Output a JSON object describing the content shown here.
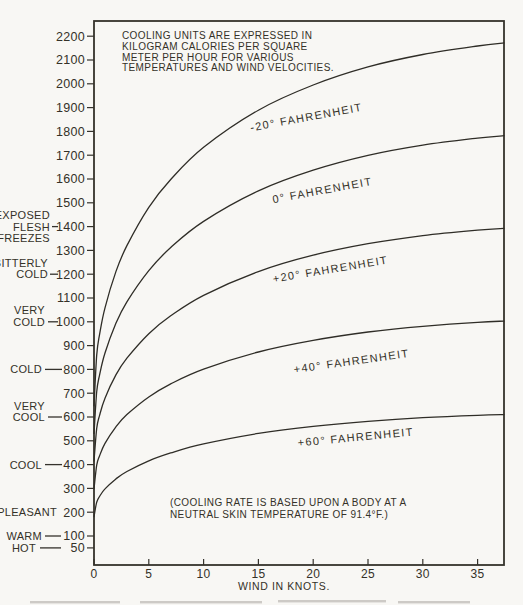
{
  "page": {
    "background": "#f8f7f4",
    "ink": "#35322c",
    "curve_color": "#2f2d27",
    "fragment_color": "#a9a6a0"
  },
  "header_note": {
    "lines": [
      "COOLING UNITS ARE EXPRESSED IN",
      "KILOGRAM CALORIES PER SQUARE",
      "METER PER HOUR FOR VARIOUS",
      "TEMPERATURES AND WIND VELOCITIES."
    ]
  },
  "body_note": {
    "lines": [
      "(COOLING RATE IS BASED UPON A BODY AT A",
      "NEUTRAL SKIN TEMPERATURE OF 91.4°F.)"
    ]
  },
  "sensation_scale": [
    {
      "lines": [
        "EXPOSED",
        "FLESH",
        "FREEZES"
      ],
      "value": 1400,
      "align_line": 1,
      "text_x": 50,
      "dash": [
        52,
        58
      ]
    },
    {
      "lines": [
        "BITTERLY",
        "COLD"
      ],
      "value": 1200,
      "align_line": 1,
      "text_x": 48,
      "dash": [
        50,
        58
      ]
    },
    {
      "lines": [
        "VERY",
        "COLD"
      ],
      "value": 1000,
      "align_line": 1,
      "text_x": 45,
      "dash": [
        48,
        58
      ]
    },
    {
      "lines": [
        "COLD"
      ],
      "value": 800,
      "align_line": 0,
      "text_x": 42,
      "dash": [
        45,
        62
      ]
    },
    {
      "lines": [
        "VERY",
        "COOL"
      ],
      "value": 600,
      "align_line": 1,
      "text_x": 45,
      "dash": [
        48,
        62
      ]
    },
    {
      "lines": [
        "COOL"
      ],
      "value": 400,
      "align_line": 0,
      "text_x": 42,
      "dash": [
        45,
        62
      ]
    },
    {
      "lines": [
        "PLEASANT"
      ],
      "value": 200,
      "align_line": 0,
      "text_x": 57,
      "dash": null
    },
    {
      "lines": [
        "WARM"
      ],
      "value": 100,
      "align_line": 0,
      "text_x": 42,
      "dash": [
        45,
        61
      ]
    },
    {
      "lines": [
        "HOT"
      ],
      "value": 50,
      "align_line": 0,
      "text_x": 36,
      "dash": [
        40,
        61
      ]
    }
  ],
  "chart_data": {
    "type": "line",
    "title": "",
    "xlabel": "WIND IN KNOTS.",
    "ylabel": "",
    "x_ticks": [
      0,
      5,
      10,
      15,
      20,
      25,
      30,
      35
    ],
    "y_ticks": [
      2200,
      2100,
      2000,
      1900,
      1800,
      1700,
      1600,
      1500,
      1400,
      1300,
      1200,
      1100,
      1000,
      900,
      800,
      700,
      600,
      500,
      400,
      300,
      200,
      100,
      50
    ],
    "xlim": [
      0,
      37.4
    ],
    "ylim": [
      0,
      2260
    ],
    "grid": false,
    "legend": "inline-curve-labels",
    "x": [
      0,
      0.25,
      0.5,
      1,
      2,
      3,
      5,
      7,
      10,
      15,
      20,
      25,
      30,
      35,
      37.4
    ],
    "series": [
      {
        "name": "-20° FAHRENHEIT",
        "values": [
          647,
          860,
          945,
          1059,
          1211,
          1320,
          1481,
          1598,
          1733,
          1889,
          1995,
          2071,
          2123,
          2159,
          2172
        ],
        "label": {
          "x": 307,
          "y": 121,
          "angle": -10.5
        }
      },
      {
        "name": "0° FAHRENHEIT",
        "values": [
          531,
          706,
          775,
          869,
          994,
          1084,
          1215,
          1312,
          1422,
          1550,
          1637,
          1699,
          1742,
          1772,
          1782
        ],
        "label": {
          "x": 323,
          "y": 194,
          "angle": -10.5
        }
      },
      {
        "name": "+20° FAHRENHEIT",
        "values": [
          415,
          552,
          606,
          679,
          777,
          847,
          950,
          1025,
          1111,
          1211,
          1280,
          1328,
          1362,
          1385,
          1393
        ],
        "label": {
          "x": 331,
          "y": 273,
          "angle": -9.5
        }
      },
      {
        "name": "+40° FAHRENHEIT",
        "values": [
          299,
          398,
          436,
          489,
          559,
          610,
          684,
          739,
          801,
          873,
          922,
          957,
          981,
          998,
          1003
        ],
        "label": {
          "x": 352,
          "y": 365,
          "angle": -8
        }
      },
      {
        "name": "+60° FAHRENHEIT",
        "values": [
          182,
          242,
          266,
          298,
          340,
          371,
          416,
          449,
          487,
          531,
          561,
          582,
          597,
          607,
          610
        ],
        "label": {
          "x": 356,
          "y": 441,
          "angle": -5.5
        }
      }
    ]
  },
  "caption_fragments": [
    {
      "x1": 30,
      "x2": 120,
      "y": 601
    },
    {
      "x1": 140,
      "x2": 262,
      "y": 601
    },
    {
      "x1": 278,
      "x2": 386,
      "y": 600
    },
    {
      "x1": 398,
      "x2": 470,
      "y": 601
    }
  ]
}
